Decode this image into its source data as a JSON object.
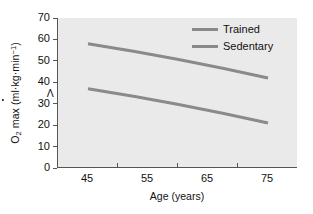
{
  "chart_data": {
    "type": "line",
    "title": "",
    "xlabel": "Age (years)",
    "ylabel_plain": "VO2 max (ml·kg·min-1)",
    "ylabel_parts": {
      "v": "V",
      "o": "O",
      "sub2": "2",
      "rest": " max (ml·kg·min",
      "sup": "−1",
      "close": ")"
    },
    "x": [
      45,
      55,
      65,
      75
    ],
    "xticklabels": [
      "45",
      "55",
      "65",
      "75"
    ],
    "yticks": [
      0,
      10,
      20,
      30,
      40,
      50,
      60,
      70
    ],
    "yticklabels": [
      "0",
      "10",
      "20",
      "30",
      "40",
      "50",
      "60",
      "70"
    ],
    "xlim": [
      40,
      80
    ],
    "ylim": [
      0,
      70
    ],
    "grid": false,
    "legend_position": "top-right-inside",
    "plot_background": "#eaeaea",
    "figure_background": "#ffffff",
    "axis_color": "#555555",
    "text_color": "#111111",
    "series": [
      {
        "name": "Trained",
        "color": "#8a8a8a",
        "x": [
          45,
          75
        ],
        "values": [
          58,
          42
        ],
        "linewidth": 3
      },
      {
        "name": "Sedentary",
        "color": "#8a8a8a",
        "x": [
          45,
          75
        ],
        "values": [
          37,
          21
        ],
        "linewidth": 3
      }
    ]
  },
  "legend": {
    "items": [
      {
        "label": "Trained",
        "color": "#8a8a8a"
      },
      {
        "label": "Sedentary",
        "color": "#8a8a8a"
      }
    ]
  }
}
